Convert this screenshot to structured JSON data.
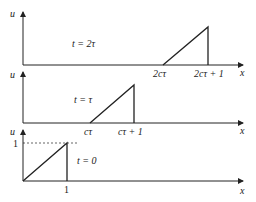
{
  "panels": [
    {
      "name": "t-2tau",
      "time_label": "t = 2τ",
      "y_axis_label": "u",
      "x_axis_label": "x",
      "tick_labels": [
        "2cτ",
        "2cτ + 1"
      ]
    },
    {
      "name": "t-tau",
      "time_label": "t = τ",
      "y_axis_label": "u",
      "x_axis_label": "x",
      "tick_labels": [
        "cτ",
        "cτ + 1"
      ]
    },
    {
      "name": "t-0",
      "time_label": "t = 0",
      "y_axis_label": "u",
      "x_axis_label": "x",
      "tick_labels": [
        "1"
      ],
      "y_tick_label": "1"
    }
  ],
  "colors": {
    "line": "#222222",
    "background": "#ffffff"
  }
}
